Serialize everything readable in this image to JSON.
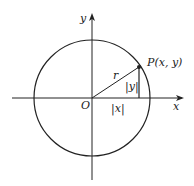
{
  "diagram": {
    "labels": {
      "y_axis": "y",
      "x_axis": "x",
      "origin": "O",
      "radius": "r",
      "point": "P(x, y)",
      "abs_y": "|y|",
      "abs_x": "|x|"
    },
    "colors": {
      "stroke": "#222222",
      "background": "#ffffff"
    }
  }
}
